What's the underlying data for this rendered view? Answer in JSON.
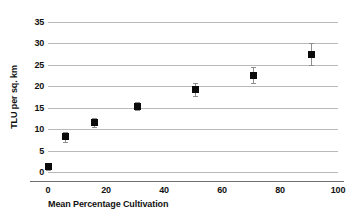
{
  "chart_data": {
    "type": "scatter",
    "title": "",
    "xlabel": "Mean Percentage Cultivation",
    "ylabel": "TLU per sq. km",
    "xlim": [
      0,
      100
    ],
    "ylim": [
      0,
      35
    ],
    "xticks": [
      0,
      20,
      40,
      60,
      80,
      100
    ],
    "yticks": [
      0,
      5,
      10,
      15,
      20,
      25,
      30,
      35
    ],
    "grid": "horizontal",
    "legend": "none",
    "x": [
      0,
      6,
      16,
      31,
      51,
      71,
      91
    ],
    "values": [
      1.2,
      8.2,
      11.5,
      15.3,
      19.3,
      22.6,
      27.5
    ],
    "y_error_low": [
      0.8,
      1.1,
      1.0,
      0.9,
      1.5,
      1.8,
      2.6
    ],
    "y_error_high": [
      0.8,
      1.1,
      1.2,
      1.0,
      1.5,
      1.8,
      2.6
    ],
    "points": [
      {
        "x": 0,
        "y": 1.2,
        "err_low": 0.8,
        "err_high": 0.8
      },
      {
        "x": 6,
        "y": 8.2,
        "err_low": 1.1,
        "err_high": 1.1
      },
      {
        "x": 16,
        "y": 11.5,
        "err_low": 1.0,
        "err_high": 1.2
      },
      {
        "x": 31,
        "y": 15.3,
        "err_low": 0.9,
        "err_high": 1.0
      },
      {
        "x": 51,
        "y": 19.3,
        "err_low": 1.5,
        "err_high": 1.5
      },
      {
        "x": 71,
        "y": 22.6,
        "err_low": 1.8,
        "err_high": 1.8
      },
      {
        "x": 91,
        "y": 27.5,
        "err_low": 2.6,
        "err_high": 2.6
      }
    ],
    "marker_color": "#0b0b0b",
    "errorbar_color": "#8e8e8e",
    "gridline_color": "#b9b9b9",
    "axis_color": "#6f6f6f",
    "background_color": "#ffffff"
  }
}
